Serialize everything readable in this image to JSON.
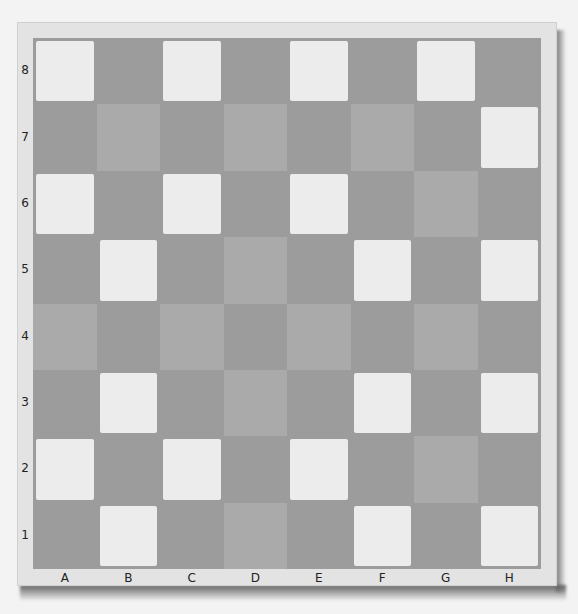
{
  "board": {
    "files": [
      "A",
      "B",
      "C",
      "D",
      "E",
      "F",
      "G",
      "H"
    ],
    "ranks": [
      "8",
      "7",
      "6",
      "5",
      "4",
      "3",
      "2",
      "1"
    ],
    "shade_legend": {
      "w": "white",
      "m": "medium-gray",
      "d": "dark-gray"
    },
    "colors": {
      "white": "#ececec",
      "medium": "#aaaaaa",
      "dark": "#9c9c9c",
      "frame": "#e3e3e3",
      "background": "#f3f3f3"
    },
    "rows": [
      [
        "w",
        "d",
        "w",
        "d",
        "w",
        "d",
        "w",
        "d"
      ],
      [
        "d",
        "m",
        "d",
        "m",
        "d",
        "m",
        "d",
        "w"
      ],
      [
        "w",
        "d",
        "w",
        "d",
        "w",
        "d",
        "m",
        "d"
      ],
      [
        "d",
        "w",
        "d",
        "m",
        "d",
        "w",
        "d",
        "w"
      ],
      [
        "m",
        "d",
        "m",
        "d",
        "m",
        "d",
        "m",
        "d"
      ],
      [
        "d",
        "w",
        "d",
        "m",
        "d",
        "w",
        "d",
        "w"
      ],
      [
        "w",
        "d",
        "w",
        "d",
        "w",
        "d",
        "m",
        "d"
      ],
      [
        "d",
        "w",
        "d",
        "m",
        "d",
        "w",
        "d",
        "w"
      ]
    ]
  }
}
